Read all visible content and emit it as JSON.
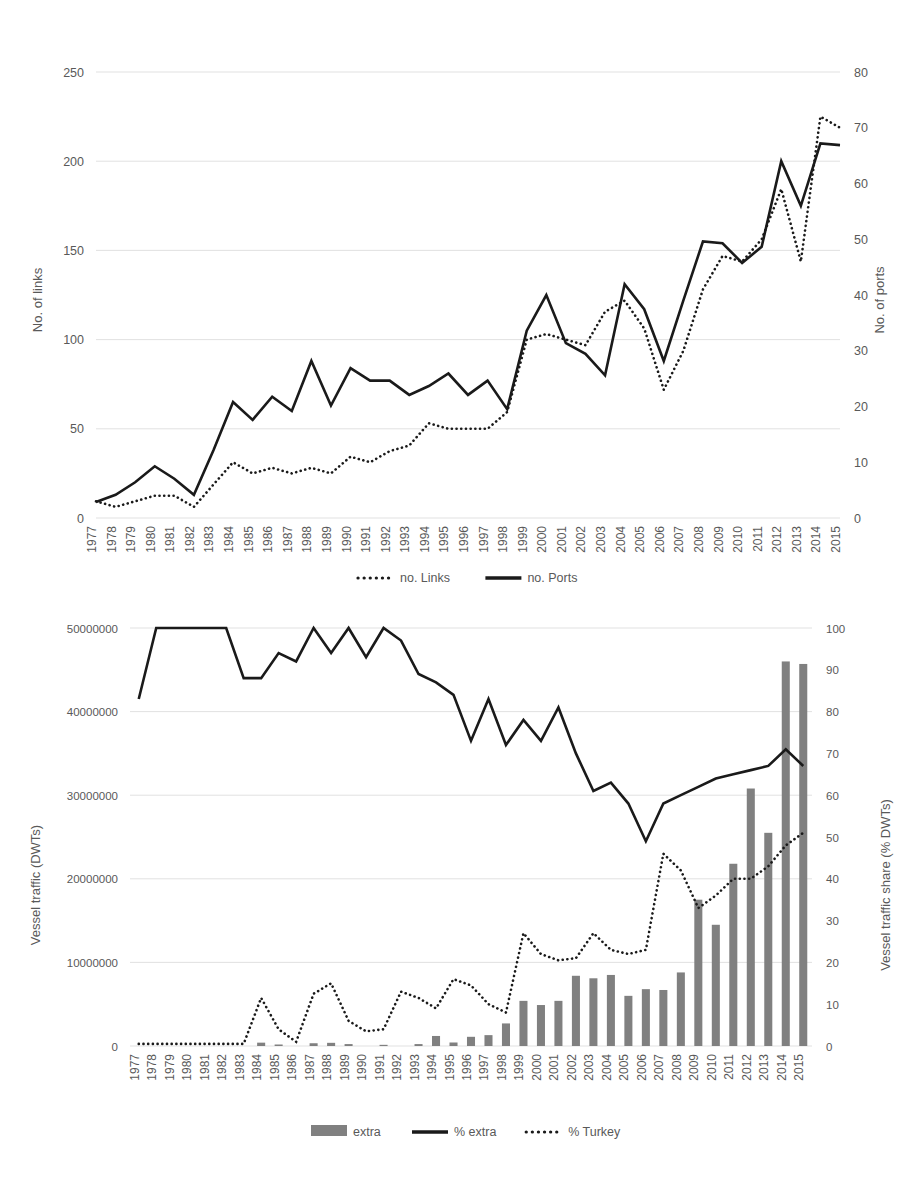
{
  "figure": {
    "background": "#ffffff",
    "line_color": "#1a1a1a",
    "bar_color": "#808080",
    "grid_color": "#d9d9d9"
  },
  "chart_data": [
    {
      "id": "chart-links-ports",
      "type": "line",
      "title": "",
      "xlabel": "",
      "ylabel": "No. of links",
      "y2label": "No. of ports",
      "grid": true,
      "legend_position": "bottom",
      "ylim": [
        0,
        250
      ],
      "y2lim": [
        0,
        80
      ],
      "yticks": [
        0,
        50,
        100,
        150,
        200,
        250
      ],
      "y2ticks": [
        0,
        10,
        20,
        30,
        40,
        50,
        60,
        70,
        80
      ],
      "categories": [
        "1977",
        "1978",
        "1979",
        "1980",
        "1981",
        "1982",
        "1983",
        "1984",
        "1985",
        "1986",
        "1987",
        "1988",
        "1989",
        "1990",
        "1991",
        "1992",
        "1993",
        "1994",
        "1995",
        "1996",
        "1997",
        "1998",
        "1999",
        "2000",
        "2001",
        "2002",
        "2003",
        "2004",
        "2005",
        "2006",
        "2007",
        "2008",
        "2009",
        "2010",
        "2011",
        "2012",
        "2013",
        "2014",
        "2015"
      ],
      "series": [
        {
          "name": "no. Links",
          "style": "dotted",
          "axis": "right",
          "units": "No. of ports",
          "values": [
            3,
            2,
            3,
            4,
            4,
            2,
            6,
            10,
            8,
            9,
            8,
            9,
            8,
            11,
            10,
            12,
            13,
            17,
            16,
            16,
            16,
            19,
            32,
            33,
            32,
            31,
            37,
            39,
            34,
            23,
            30,
            41,
            47,
            46,
            50,
            59,
            46,
            72,
            70
          ]
        },
        {
          "name": "no. Ports",
          "style": "solid",
          "axis": "left",
          "units": "No. of links",
          "values": [
            9,
            13,
            20,
            29,
            22,
            13,
            38,
            65,
            55,
            68,
            60,
            88,
            63,
            84,
            77,
            77,
            69,
            74,
            81,
            69,
            77,
            61,
            105,
            125,
            98,
            92,
            80,
            131,
            117,
            88,
            122,
            155,
            154,
            143,
            152,
            200,
            175,
            210,
            209
          ]
        }
      ]
    },
    {
      "id": "chart-vessel-traffic",
      "type": "bar+line",
      "title": "",
      "xlabel": "",
      "ylabel": "Vessel traffic (DWTs)",
      "y2label": "Vessel traffic share (% DWTs)",
      "grid": true,
      "legend_position": "bottom",
      "ylim": [
        0,
        50000000
      ],
      "y2lim": [
        0,
        100
      ],
      "yticks": [
        0,
        10000000,
        20000000,
        30000000,
        40000000,
        50000000
      ],
      "ytick_labels": [
        "0",
        "10000000",
        "20000000",
        "30000000",
        "40000000",
        "50000000"
      ],
      "y2ticks": [
        0,
        10,
        20,
        30,
        40,
        50,
        60,
        70,
        80,
        90,
        100
      ],
      "categories": [
        "1977",
        "1978",
        "1979",
        "1980",
        "1981",
        "1982",
        "1983",
        "1984",
        "1985",
        "1986",
        "1987",
        "1988",
        "1989",
        "1990",
        "1991",
        "1992",
        "1993",
        "1994",
        "1995",
        "1996",
        "1997",
        "1998",
        "1999",
        "2000",
        "2001",
        "2002",
        "2003",
        "2004",
        "2005",
        "2006",
        "2007",
        "2008",
        "2009",
        "2010",
        "2011",
        "2012",
        "2013",
        "2014",
        "2015"
      ],
      "series": [
        {
          "name": "extra",
          "style": "bar",
          "axis": "left",
          "units": "DWTs",
          "values": [
            0,
            0,
            0,
            0,
            0,
            0,
            0,
            400000,
            180000,
            0,
            330000,
            380000,
            230000,
            0,
            140000,
            0,
            230000,
            1200000,
            420000,
            1100000,
            1300000,
            2700000,
            5400000,
            4900000,
            5400000,
            8400000,
            8100000,
            8500000,
            6000000,
            6800000,
            6700000,
            8800000,
            17500000,
            14500000,
            21800000,
            30800000,
            25500000,
            46000000,
            45700000
          ]
        },
        {
          "name": "% extra",
          "style": "solid",
          "axis": "right",
          "units": "% DWTs",
          "values": [
            83,
            100,
            100,
            100,
            100,
            100,
            88,
            88,
            94,
            92,
            100,
            94,
            100,
            93,
            100,
            97,
            89,
            87,
            84,
            73,
            83,
            72,
            78,
            73,
            81,
            70,
            61,
            63,
            58,
            49,
            58,
            60,
            62,
            64,
            65,
            66,
            67,
            71,
            67
          ]
        },
        {
          "name": "% Turkey",
          "style": "dotted",
          "axis": "right",
          "units": "% DWTs",
          "values": [
            0.5,
            0.5,
            0.5,
            0.5,
            0.5,
            0.5,
            0.5,
            11.5,
            4,
            1,
            12.5,
            15,
            6,
            3.5,
            4,
            13,
            11.5,
            9,
            16,
            14.5,
            10,
            8,
            27,
            22,
            20.5,
            21,
            27,
            23,
            22,
            23,
            46,
            42,
            33,
            36,
            40,
            40,
            43,
            48,
            51,
            53,
            54,
            54,
            57,
            59,
            57
          ]
        }
      ]
    }
  ],
  "chart1": {
    "y_axis_title": "No. of links",
    "y2_axis_title": "No. of ports",
    "legend": [
      {
        "label": "no. Links",
        "marker": "dotted-line"
      },
      {
        "label": "no. Ports",
        "marker": "solid-line"
      }
    ]
  },
  "chart2": {
    "y_axis_title": "Vessel traffic (DWTs)",
    "y2_axis_title": "Vessel traffic share (% DWTs)",
    "legend": [
      {
        "label": "extra",
        "marker": "gray-bar"
      },
      {
        "label": "% extra",
        "marker": "solid-line"
      },
      {
        "label": "% Turkey",
        "marker": "dotted-line"
      }
    ]
  }
}
